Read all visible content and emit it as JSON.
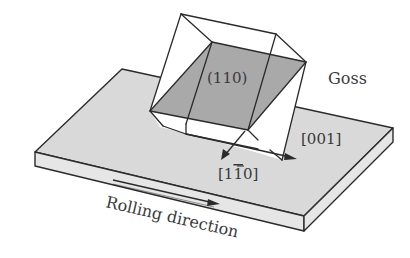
{
  "figure": {
    "labels": {
      "plane": "(110)",
      "texture_name": "Goss",
      "direction_001": "[001]",
      "direction_1m10_prefix": "[1",
      "direction_1m10_bar_digit": "1",
      "direction_1m10_suffix": "0]",
      "rolling_direction": "Rolling direction"
    },
    "colors": {
      "plate_top": "#d9d9d9",
      "plate_side": "#e6e6e6",
      "plane_fill": "#a9a9a9",
      "cube_face": "#ffffff",
      "stroke": "#2b2b2b",
      "text": "#3a3a3a"
    }
  }
}
